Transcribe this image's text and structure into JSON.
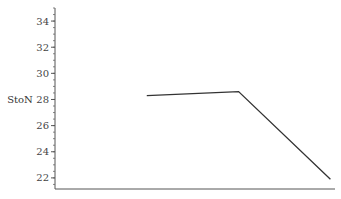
{
  "chart_data": {
    "type": "line",
    "title": "",
    "xlabel": "",
    "ylabel": "StoN",
    "x": [
      1,
      2,
      3
    ],
    "series": [
      {
        "name": "StoN",
        "values": [
          28.3,
          28.6,
          21.9
        ]
      }
    ],
    "xlim": [
      0,
      3.05
    ],
    "ylim": [
      21.15,
      35
    ],
    "yticks": [
      22,
      24,
      26,
      28,
      30,
      32,
      34
    ],
    "ytick_labels": [
      "22",
      "24",
      "26",
      "28",
      "30",
      "32",
      "34"
    ],
    "minor_ytick_step": 0.5,
    "grid": false,
    "legend": "none",
    "line_color": "#333333"
  }
}
